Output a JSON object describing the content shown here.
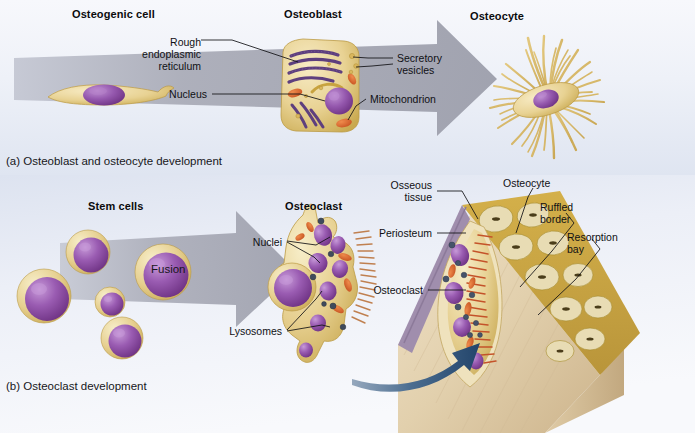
{
  "figure": {
    "width": 695,
    "height": 433,
    "background": "#ffffff"
  },
  "palette": {
    "cytoplasm_light": "#f2e2b0",
    "cytoplasm_mid": "#e3cb86",
    "cytoplasm_edge": "#c9a94f",
    "nucleus_light": "#b07cc6",
    "nucleus_mid": "#8d4fa5",
    "nucleus_dark": "#6d3180",
    "mitochondrion": "#d9622b",
    "rer": "#5e3f7e",
    "lysosome": "#4a5568",
    "arrow_gray": "#a9aab4",
    "arrow_blue": "#2c4f72",
    "bone_tan": "#e7d5b6",
    "bone_shadow": "#cbb591",
    "osseous_gold": "#c8a43c",
    "periosteum": "#9c8aa8",
    "ruffled_border": "#c4532a",
    "panel_bg_top": "#f4f6fb",
    "panel_bg_blue": "#ccd4e6",
    "label_text": "#101014"
  },
  "panel_a": {
    "caption": "(a) Osteoblast and osteocyte development",
    "titles": [
      {
        "text": "Osteogenic cell",
        "x": 72,
        "y": 8
      },
      {
        "text": "Osteoblast",
        "x": 284,
        "y": 8
      },
      {
        "text": "Osteocyte",
        "x": 470,
        "y": 10
      }
    ],
    "labels": [
      {
        "name": "rough-endoplasmic-reticulum",
        "lines": [
          "Rough",
          "endoplasmic",
          "reticulum"
        ],
        "x": 196,
        "y": 36,
        "align": "right"
      },
      {
        "name": "nucleus",
        "lines": [
          "Nucleus"
        ],
        "x": 207,
        "y": 91,
        "align": "right"
      },
      {
        "name": "secretory-vesicles",
        "lines": [
          "Secretory",
          "vesicles"
        ],
        "x": 397,
        "y": 52,
        "align": "left"
      },
      {
        "name": "mitochondrion",
        "lines": [
          "Mitochondrion"
        ],
        "x": 370,
        "y": 95,
        "align": "left"
      }
    ],
    "arrow": {
      "name": "differentiation-arrow",
      "from_x": 20,
      "to_x": 500,
      "y": 78
    }
  },
  "panel_b": {
    "caption": "(b) Osteoclast development",
    "titles": [
      {
        "text": "Stem cells",
        "x": 88,
        "y": 200
      },
      {
        "text": "Osteoclast",
        "x": 285,
        "y": 200
      }
    ],
    "fusion_label": "Fusion",
    "labels": [
      {
        "name": "nuclei",
        "lines": [
          "Nuclei"
        ],
        "x": 282,
        "y": 246,
        "align": "right"
      },
      {
        "name": "lysosomes",
        "lines": [
          "Lysosomes"
        ],
        "x": 282,
        "y": 334,
        "align": "right"
      },
      {
        "name": "osseous-tissue",
        "lines": [
          "Osseous",
          "tissue"
        ],
        "x": 432,
        "y": 185,
        "align": "right"
      },
      {
        "name": "periosteum",
        "lines": [
          "Periosteum"
        ],
        "x": 432,
        "y": 234,
        "align": "right"
      },
      {
        "name": "osteoclast-bone",
        "lines": [
          "Osteoclast"
        ],
        "x": 423,
        "y": 291,
        "align": "right"
      },
      {
        "name": "osteocyte-bone",
        "lines": [
          "Osteocyte"
        ],
        "x": 517,
        "y": 182,
        "align": "left"
      },
      {
        "name": "ruffled-border",
        "lines": [
          "Ruffled",
          "border"
        ],
        "x": 556,
        "y": 200,
        "align": "left"
      },
      {
        "name": "resorption-bay",
        "lines": [
          "Resorption",
          "bay"
        ],
        "x": 578,
        "y": 236,
        "align": "left"
      }
    ],
    "stem_cells": [
      {
        "cx": 44,
        "cy": 296,
        "r": 27
      },
      {
        "cx": 88,
        "cy": 252,
        "r": 22
      },
      {
        "cx": 110,
        "cy": 302,
        "r": 15
      },
      {
        "cx": 163,
        "cy": 272,
        "r": 28
      },
      {
        "cx": 122,
        "cy": 338,
        "r": 21
      }
    ]
  },
  "structures": {
    "osteogenic_cell": {
      "cx": 105,
      "cy": 100
    },
    "osteoblast": {
      "cx": 315,
      "cy": 88
    },
    "osteocyte": {
      "cx": 550,
      "cy": 95,
      "process_count": 34
    },
    "osteoclast": {
      "cx": 318,
      "cy": 290
    },
    "bone_block": {
      "cx": 520,
      "cy": 300
    }
  }
}
